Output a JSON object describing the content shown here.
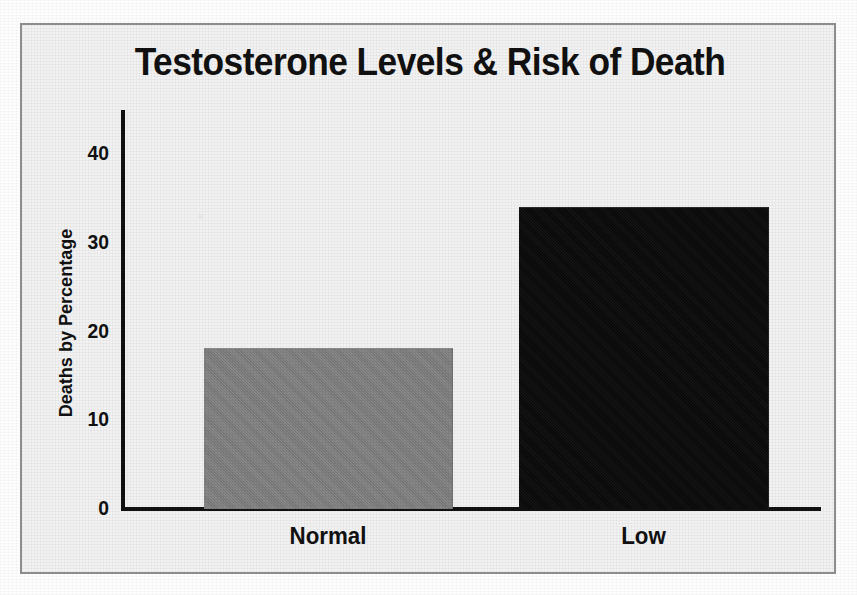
{
  "figure": {
    "title": "Testosterone Levels & Risk of Death",
    "background_color": "#f2f2f2",
    "border_color": "#8d8d8d",
    "text_color": "#111111"
  },
  "chart_data": {
    "type": "bar",
    "title": "Testosterone Levels & Risk of Death",
    "subtitle": "",
    "xlabel": "",
    "ylabel": "Deaths by Percentage",
    "categories": [
      "Normal",
      "Low"
    ],
    "values": [
      18,
      34
    ],
    "series": [
      {
        "name": "Deaths by Percentage",
        "values": [
          18,
          34
        ],
        "colors": [
          "#808080",
          "#0b0b0b"
        ]
      }
    ],
    "ylim": [
      0,
      45
    ],
    "yticks": [
      0,
      10,
      20,
      30,
      40
    ],
    "ytick_labels": [
      "0",
      "10",
      "20",
      "30",
      "40"
    ],
    "grid": false,
    "legend": false,
    "legend_position": "none",
    "annotations": []
  },
  "axes": {
    "y_title": "Deaths by Percentage",
    "y_tick_labels": [
      "40",
      "30",
      "20",
      "10",
      "0"
    ],
    "x_tick_labels": [
      "Normal",
      "Low"
    ]
  },
  "bars": [
    {
      "category": "Normal",
      "value": 18,
      "color": "#808080"
    },
    {
      "category": "Low",
      "value": 34,
      "color": "#0b0b0b"
    }
  ]
}
